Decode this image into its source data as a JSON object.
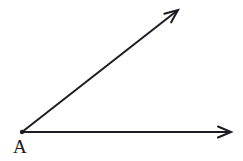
{
  "figure": {
    "kind": "geometry-angle-diagram",
    "width": 243,
    "height": 161,
    "background_color": "#ffffff",
    "stroke_color": "#1c1c22",
    "stroke_width": 2
  },
  "vertex": {
    "label": "A",
    "label_left": 13,
    "label_top": 137,
    "x": 22,
    "y": 132,
    "dot_radius": 2.2
  },
  "rays": [
    {
      "name": "horizontal-ray",
      "from_x": 22,
      "from_y": 132,
      "to_x": 231,
      "to_y": 132,
      "arrowhead": "open-v",
      "direction_degrees": 0
    },
    {
      "name": "diagonal-ray",
      "from_x": 22,
      "from_y": 132,
      "to_x": 178,
      "to_y": 10,
      "arrowhead": "open-v",
      "direction_degrees": 38
    }
  ],
  "arrowhead": {
    "length": 13,
    "half_width": 5.5,
    "stroke_width": 2
  }
}
